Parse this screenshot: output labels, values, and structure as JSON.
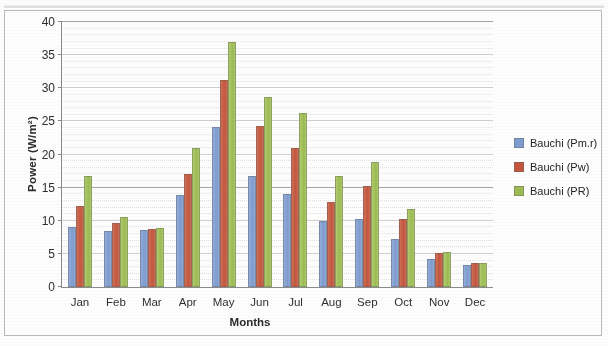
{
  "chart_data": {
    "type": "bar",
    "title": "",
    "xlabel": "Months",
    "ylabel": "Power (W/m²)",
    "categories": [
      "Jan",
      "Feb",
      "Mar",
      "Apr",
      "May",
      "Jun",
      "Jul",
      "Aug",
      "Sep",
      "Oct",
      "Nov",
      "Dec"
    ],
    "ylim": [
      0,
      40
    ],
    "yticks": [
      0,
      5,
      10,
      15,
      20,
      25,
      30,
      35,
      40
    ],
    "ytick_labels": [
      "0",
      "5",
      "10",
      "15",
      "20",
      "25",
      "30",
      "35",
      "40"
    ],
    "grid": true,
    "legend_position": "right",
    "series": [
      {
        "name": "Bauchi (Pm.r)",
        "color": "#7e9ccd",
        "values": [
          9.0,
          8.5,
          8.6,
          13.9,
          24.1,
          16.8,
          14.1,
          9.9,
          10.2,
          7.3,
          4.2,
          3.3
        ]
      },
      {
        "name": "Bauchi (Pw)",
        "color": "#c4563f",
        "values": [
          12.3,
          9.6,
          8.7,
          17.0,
          31.3,
          24.3,
          21.0,
          12.8,
          15.2,
          10.2,
          5.2,
          3.6
        ]
      },
      {
        "name": "Bauchi (PR)",
        "color": "#9cbb55",
        "values": [
          16.7,
          10.6,
          8.9,
          21.0,
          37.0,
          28.7,
          26.3,
          16.8,
          18.9,
          11.8,
          5.3,
          3.6
        ]
      }
    ]
  }
}
